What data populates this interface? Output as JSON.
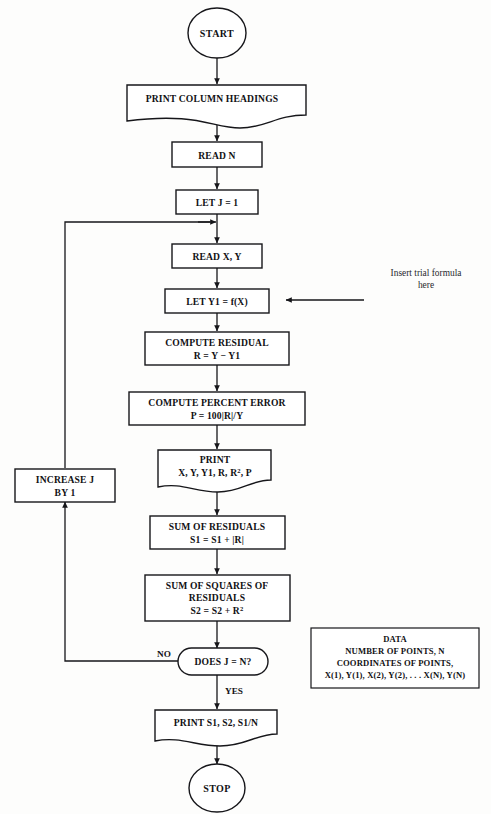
{
  "diagram": {
    "line_color": "#16161a",
    "text_color": "#111114",
    "background": "#fdfdfc"
  },
  "nodes": {
    "start": {
      "label": "START",
      "shape": "terminator-circle"
    },
    "print_headings": {
      "label": "PRINT COLUMN HEADINGS",
      "shape": "document"
    },
    "read_n": {
      "label": "READ  N",
      "shape": "process"
    },
    "let_j": {
      "label": "LET J = 1",
      "shape": "process"
    },
    "read_xy": {
      "label": "READ X, Y",
      "shape": "process"
    },
    "let_y1": {
      "label": "LET Y1 = f(X)",
      "shape": "process"
    },
    "compute_residual": {
      "line1": "COMPUTE RESIDUAL",
      "line2": "R = Y − Y1",
      "shape": "process"
    },
    "compute_percent_error": {
      "line1": "COMPUTE PERCENT ERROR",
      "line2": "P = 100|R|/Y",
      "shape": "process"
    },
    "print_values": {
      "line1": "PRINT",
      "line2_a": "X, Y, Y1, R, R",
      "line2_sup": "2",
      "line2_b": ", P",
      "shape": "document"
    },
    "sum_residuals": {
      "line1": "SUM OF RESIDUALS",
      "line2": "S1 = S1 + |R|",
      "shape": "process"
    },
    "sum_squares": {
      "line1": "SUM OF SQUARES OF",
      "line2": "RESIDUALS",
      "line3_a": "S2 = S2 + R",
      "line3_sup": "2",
      "shape": "process"
    },
    "decision": {
      "label": "DOES J = N?",
      "shape": "oval-decision"
    },
    "increase_j": {
      "line1": "INCREASE J",
      "line2": "BY 1",
      "shape": "process"
    },
    "print_totals": {
      "label": "PRINT  S1, S2, S1/N",
      "shape": "document"
    },
    "stop": {
      "label": "STOP",
      "shape": "terminator-circle"
    }
  },
  "branch_labels": {
    "no": "NO",
    "yes": "YES"
  },
  "annotation": {
    "line1": "Insert trial formula",
    "line2": "here"
  },
  "data_box": {
    "line1": "DATA",
    "line2": "NUMBER OF POINTS, N",
    "line3": "COORDINATES OF POINTS,",
    "line4": "X(1), Y(1), X(2), Y(2), . . . X(N), Y(N)"
  }
}
